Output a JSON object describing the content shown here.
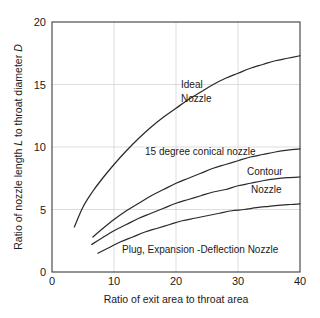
{
  "chart_data": {
    "type": "line",
    "title": "",
    "xlabel": "Ratio of exit area to throat area",
    "ylabel": "Ratio of nozzle length L to throat diameter D",
    "ylabel_parts": {
      "seg1": "Ratio of nozzle length ",
      "italic1": "L",
      "seg2": " to throat diameter ",
      "italic2": "D"
    },
    "xlim": [
      0,
      40
    ],
    "ylim": [
      0,
      20
    ],
    "xticks": [
      0,
      10,
      20,
      30,
      40
    ],
    "yticks": [
      0,
      5,
      10,
      15,
      20
    ],
    "xtick_labels": [
      "0",
      "10",
      "20",
      "30",
      "40"
    ],
    "ytick_labels": [
      "0",
      "5",
      "10",
      "15",
      "20"
    ],
    "grid": "light gridlines at interior ticks, both axes",
    "legend": "inline curve labels, no legend box",
    "series": [
      {
        "name": "Ideal Nozzle",
        "label": "Ideal Nozzle",
        "label_lines": [
          "Ideal",
          "Nozzle"
        ],
        "color": "#2b2b2b",
        "points": [
          [
            3.6,
            3.6
          ],
          [
            5.0,
            5.2
          ],
          [
            6.5,
            6.4
          ],
          [
            8.0,
            7.4
          ],
          [
            10.0,
            8.6
          ],
          [
            12.0,
            9.7
          ],
          [
            14.0,
            10.7
          ],
          [
            16.0,
            11.6
          ],
          [
            18.0,
            12.4
          ],
          [
            20.0,
            13.1
          ],
          [
            22.0,
            13.8
          ],
          [
            24.0,
            14.4
          ],
          [
            26.0,
            15.0
          ],
          [
            28.0,
            15.5
          ],
          [
            30.0,
            15.9
          ],
          [
            32.0,
            16.3
          ],
          [
            34.0,
            16.6
          ],
          [
            36.0,
            16.9
          ],
          [
            38.0,
            17.1
          ],
          [
            40.0,
            17.3
          ]
        ]
      },
      {
        "name": "15 degree conical nozzle",
        "label": "15 degree conical nozzle",
        "label_lines": [
          "15 degree conical nozzle"
        ],
        "color": "#2b2b2b",
        "points": [
          [
            6.6,
            2.8
          ],
          [
            8.0,
            3.4
          ],
          [
            10.0,
            4.2
          ],
          [
            12.0,
            4.9
          ],
          [
            14.0,
            5.5
          ],
          [
            16.0,
            6.1
          ],
          [
            18.0,
            6.6
          ],
          [
            20.0,
            7.1
          ],
          [
            22.0,
            7.5
          ],
          [
            24.0,
            7.9
          ],
          [
            26.0,
            8.3
          ],
          [
            28.0,
            8.6
          ],
          [
            30.0,
            8.9
          ],
          [
            32.0,
            9.2
          ],
          [
            34.0,
            9.4
          ],
          [
            36.0,
            9.6
          ],
          [
            38.0,
            9.75
          ],
          [
            40.0,
            9.85
          ]
        ]
      },
      {
        "name": "Contour Nozzle",
        "label": "Contour Nozzle",
        "label_lines": [
          "Contour",
          "Nozzle"
        ],
        "color": "#2b2b2b",
        "points": [
          [
            6.4,
            2.2
          ],
          [
            8.0,
            2.7
          ],
          [
            10.0,
            3.3
          ],
          [
            12.0,
            3.8
          ],
          [
            14.0,
            4.3
          ],
          [
            16.0,
            4.7
          ],
          [
            18.0,
            5.1
          ],
          [
            20.0,
            5.5
          ],
          [
            22.0,
            5.8
          ],
          [
            24.0,
            6.1
          ],
          [
            26.0,
            6.4
          ],
          [
            28.0,
            6.6
          ],
          [
            30.0,
            6.9
          ],
          [
            32.0,
            7.1
          ],
          [
            34.0,
            7.3
          ],
          [
            36.0,
            7.45
          ],
          [
            38.0,
            7.55
          ],
          [
            40.0,
            7.6
          ]
        ]
      },
      {
        "name": "Plug, Expansion -Deflection Nozzle",
        "label": "Plug, Expansion -Deflection Nozzle",
        "label_lines": [
          "Plug, Expansion -Deflection Nozzle"
        ],
        "color": "#2b2b2b",
        "points": [
          [
            7.4,
            1.5
          ],
          [
            9.0,
            1.9
          ],
          [
            11.0,
            2.4
          ],
          [
            13.0,
            2.8
          ],
          [
            15.0,
            3.2
          ],
          [
            17.0,
            3.5
          ],
          [
            19.0,
            3.8
          ],
          [
            21.0,
            4.1
          ],
          [
            23.0,
            4.3
          ],
          [
            25.0,
            4.5
          ],
          [
            27.0,
            4.7
          ],
          [
            29.0,
            4.9
          ],
          [
            31.0,
            5.0
          ],
          [
            33.0,
            5.15
          ],
          [
            35.0,
            5.25
          ],
          [
            37.0,
            5.35
          ],
          [
            38.5,
            5.4
          ],
          [
            40.0,
            5.45
          ]
        ]
      }
    ],
    "annotations": [
      {
        "text": "Ideal",
        "x": 19.5,
        "y": 13.6
      },
      {
        "text": "Nozzle",
        "x": 19.5,
        "y": 12.5
      },
      {
        "text": "15 degree conical nozzle",
        "x": 16.0,
        "y": 9.6
      },
      {
        "text": "Contour",
        "x": 32.0,
        "y": 8.0
      },
      {
        "text": "Nozzle",
        "x": 33.0,
        "y": 6.6
      },
      {
        "text": "Plug, Expansion -Deflection Nozzle",
        "x": 12.5,
        "y": 1.85
      }
    ]
  }
}
